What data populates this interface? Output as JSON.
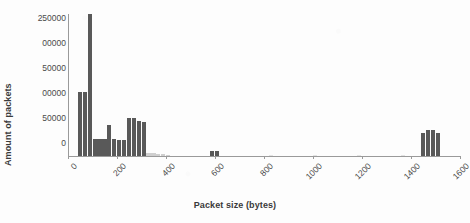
{
  "chart_data": {
    "type": "bar",
    "title": "",
    "xlabel": "Packet size (bytes)",
    "ylabel": "Amount of packets",
    "xlim": [
      0,
      1600
    ],
    "ylim": [
      0,
      250000
    ],
    "grid": false,
    "legend": null,
    "bar_color": "#595959",
    "x_tick_labels": [
      "0",
      "200",
      "400",
      "600",
      "800",
      "1000",
      "1200",
      "1400",
      "1600"
    ],
    "x_tick_values": [
      0,
      200,
      400,
      600,
      800,
      1000,
      1200,
      1400,
      1600
    ],
    "y_tick_labels": [
      "250000",
      "00000",
      "50000",
      "00000",
      "50000",
      "0"
    ],
    "y_tick_labels_full": [
      "250000",
      "200000",
      "150000",
      "100000",
      "50000",
      "0"
    ],
    "y_tick_values": [
      250000,
      200000,
      150000,
      100000,
      50000,
      0
    ],
    "note_clipped_labels": "Leading digits of 200000, 150000 and 100000 are cut off at the left image edge",
    "bin_width": 20,
    "x": [
      40,
      60,
      80,
      100,
      120,
      140,
      160,
      180,
      200,
      220,
      240,
      260,
      280,
      300,
      320,
      340,
      360,
      380,
      400,
      580,
      600,
      820,
      1000,
      1180,
      1360,
      1440,
      1460,
      1480,
      1500
    ],
    "values": [
      112000,
      112000,
      248000,
      30000,
      30000,
      30000,
      55000,
      30000,
      28000,
      28000,
      66000,
      66000,
      62000,
      60000,
      6000,
      5000,
      4000,
      3000,
      2500,
      9000,
      9000,
      1500,
      1500,
      1500,
      1500,
      41000,
      45000,
      45000,
      41000
    ]
  },
  "axes": {
    "y_title": "Amount of packets",
    "x_title": "Packet size (bytes)"
  }
}
